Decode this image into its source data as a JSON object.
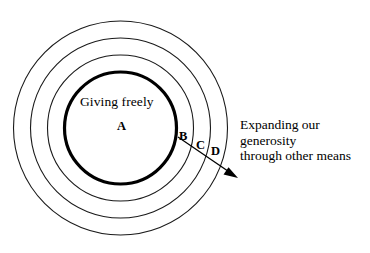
{
  "figure": {
    "type": "concentric-circles-diagram",
    "background_color": "#ffffff",
    "stroke_color": "#000000",
    "center_label": {
      "title": "Giving freely",
      "letter": "A"
    },
    "zone_labels": [
      {
        "id": "B",
        "text": "B"
      },
      {
        "id": "C",
        "text": "C"
      },
      {
        "id": "D",
        "text": "D"
      }
    ],
    "caption": {
      "line1": "Expanding our",
      "line2": "generosity",
      "line3": "through other means"
    },
    "rings": [
      {
        "id": "A",
        "radius": 56,
        "weight": "thick"
      },
      {
        "id": "B",
        "radius": 73,
        "weight": "thin"
      },
      {
        "id": "C",
        "radius": 90,
        "weight": "thin"
      },
      {
        "id": "D",
        "radius": 107,
        "weight": "thin"
      }
    ],
    "center": {
      "x": 120.5,
      "y": 128
    },
    "arrow": {
      "start": {
        "x": 178,
        "y": 137
      },
      "end": {
        "x": 237,
        "y": 177
      },
      "direction": "outward"
    }
  }
}
